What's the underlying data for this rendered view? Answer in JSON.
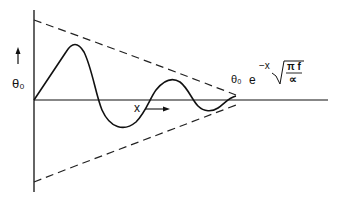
{
  "figure": {
    "type": "damped-wave-diagram",
    "y_axis_label": "θ₀",
    "x_axis_label": "x",
    "envelope_label": {
      "amplitude": "θ₀",
      "base": "e",
      "exponent_prefix": "−x",
      "fraction_numerator": "π f",
      "fraction_denominator": "∝"
    },
    "colors": {
      "ink": "#111111",
      "background": "#ffffff"
    }
  }
}
